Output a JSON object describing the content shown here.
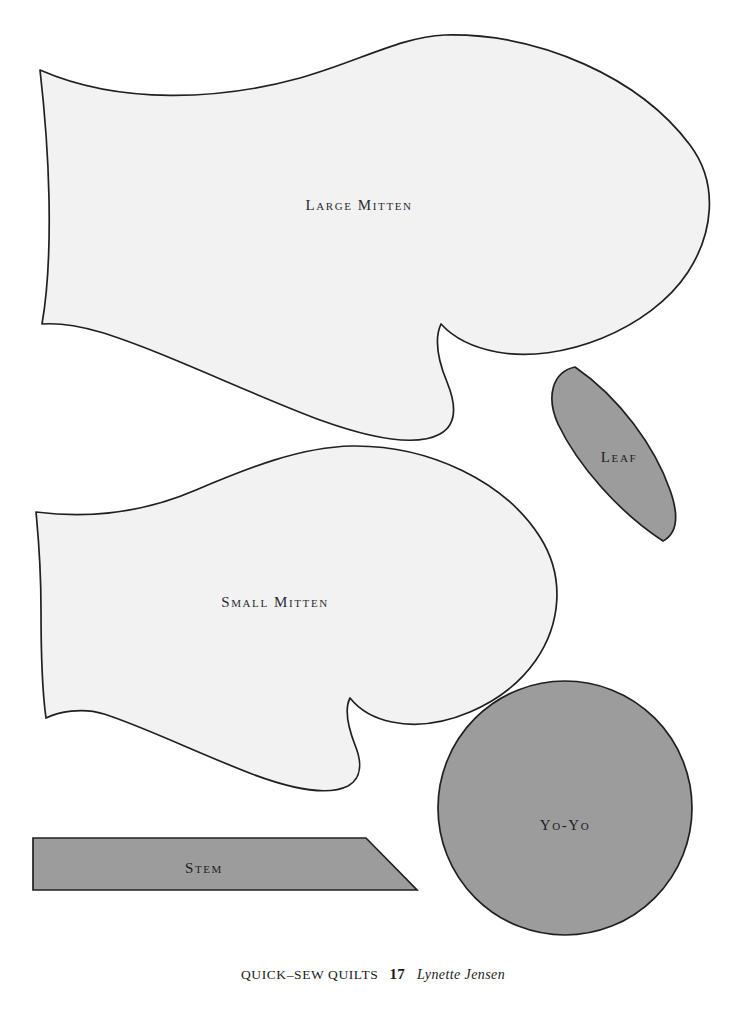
{
  "page": {
    "background_color": "#ffffff",
    "width": 746,
    "height": 1027
  },
  "palette": {
    "outline": "#231f20",
    "piece_fill_light": "#f2f2f2",
    "piece_fill_gray": "#9c9c9c",
    "label_text": "#2b2b33",
    "footer_text": "#1a1a1a"
  },
  "templates": [
    {
      "id": "large-mitten",
      "label": "Large Mitten",
      "fill": "#f2f2f2",
      "label_x": 359,
      "label_y": 205
    },
    {
      "id": "small-mitten",
      "label": "Small Mitten",
      "fill": "#f2f2f2",
      "label_x": 275,
      "label_y": 602
    },
    {
      "id": "leaf",
      "label": "Leaf",
      "fill": "#9c9c9c",
      "label_x": 619,
      "label_y": 457
    },
    {
      "id": "yo-yo",
      "label": "Yo-Yo",
      "fill": "#9c9c9c",
      "label_x": 565,
      "label_y": 825
    },
    {
      "id": "stem",
      "label": "Stem",
      "fill": "#9c9c9c",
      "label_x": 204,
      "label_y": 868
    }
  ],
  "footer": {
    "book_title": "QUICK–SEW QUILTS",
    "page_number": "17",
    "author": "Lynette Jensen"
  }
}
